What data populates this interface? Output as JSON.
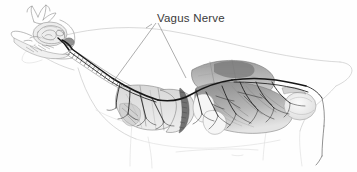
{
  "figure": {
    "title": "Vagus Nerve",
    "background_color": "#fefefe",
    "label_color": "#3a3a3a",
    "nerve_ink_color": "#161616",
    "outline_color": "#c9c9c9"
  },
  "labels": {
    "vagus_nerve": "Vagus Nerve"
  },
  "anatomy": {
    "head": "skull-with-horns",
    "brain": "cranial-cavity",
    "trachea": "segmented-trachea",
    "lungs": "lung-lobes",
    "stomach": "rumen-stomach-mass",
    "rear_organ": "pale-abdominal-organ",
    "body": "body-outline-lateral"
  },
  "leader_lines": {
    "count": 2,
    "origin": {
      "x": 157,
      "y": 22
    },
    "endpoints": [
      {
        "x": 113,
        "y": 82,
        "target": "cervical-vagus-along-trachea"
      },
      {
        "x": 186,
        "y": 78,
        "target": "abdominal-vagus-at-stomach"
      }
    ]
  }
}
